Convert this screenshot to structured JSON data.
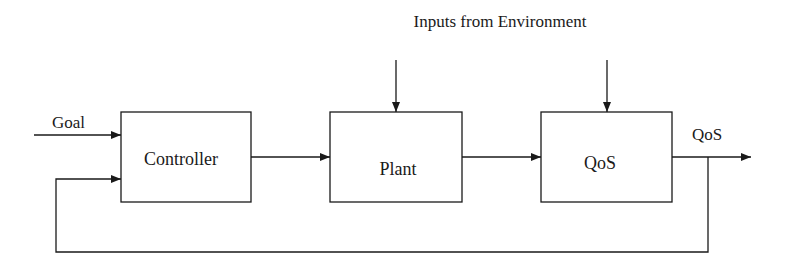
{
  "diagram": {
    "title": "Inputs from Environment",
    "blocks": [
      {
        "id": "controller",
        "label": "Controller"
      },
      {
        "id": "plant",
        "label": "Plant"
      },
      {
        "id": "qos",
        "label": "QoS"
      }
    ],
    "signals": {
      "goal": "Goal",
      "output": "QoS"
    },
    "colors": {
      "line": "#1a1a1a",
      "background": "#ffffff"
    }
  }
}
